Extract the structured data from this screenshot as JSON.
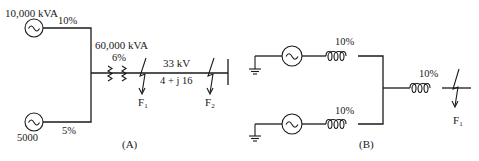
{
  "panel_a": {
    "caption": "(A)",
    "generator_top": {
      "rating": "10,000 kVA",
      "reactance": "10%"
    },
    "generator_bottom": {
      "rating": "5000",
      "reactance": "5%"
    },
    "transformer": {
      "rating": "60,000 kVA",
      "reactance": "6%"
    },
    "line": {
      "voltage": "33 kV",
      "impedance": "4 + j 16"
    },
    "faults": [
      {
        "label": "F",
        "sub": "1"
      },
      {
        "label": "F",
        "sub": "2"
      }
    ]
  },
  "panel_b": {
    "caption": "(B)",
    "branch_top": {
      "reactance": "10%"
    },
    "branch_bottom": {
      "reactance": "10%"
    },
    "series": {
      "reactance": "10%"
    },
    "fault": {
      "label": "F",
      "sub": "1"
    }
  }
}
